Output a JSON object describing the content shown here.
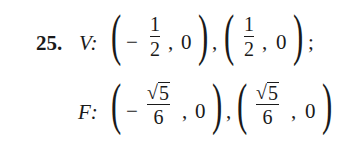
{
  "problem": {
    "number": "25.",
    "vertices": {
      "label": "V:",
      "points": [
        {
          "sign": "−",
          "numerator": "1",
          "denominator": "2",
          "y": "0"
        },
        {
          "sign": "",
          "numerator": "1",
          "denominator": "2",
          "y": "0"
        }
      ],
      "terminator": ";"
    },
    "foci": {
      "label": "F:",
      "points": [
        {
          "sign": "−",
          "radical": "√",
          "radicand": "5",
          "denominator": "6",
          "y": "0"
        },
        {
          "sign": "",
          "radical": "√",
          "radicand": "5",
          "denominator": "6",
          "y": "0"
        }
      ]
    },
    "separator": ",",
    "comma": ",",
    "open_paren": "(",
    "close_paren": ")"
  }
}
